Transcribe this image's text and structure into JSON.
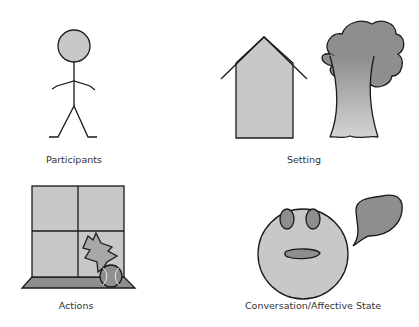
{
  "panels": [
    {
      "id": "participants",
      "label": "Participants",
      "icon": "stick-figure-icon"
    },
    {
      "id": "setting",
      "label": "Setting",
      "icon": "house-and-tree-icon"
    },
    {
      "id": "actions",
      "label": "Actions",
      "icon": "broken-window-ball-icon"
    },
    {
      "id": "conversation",
      "label": "Conversation/Affective State",
      "icon": "face-speech-bubble-icon"
    }
  ],
  "colors": {
    "stroke": "#1a1a1a",
    "light_gray": "#c8c8c8",
    "mid_gray": "#a8a8a8",
    "dark_gray": "#8a8a8a",
    "label": "#333333"
  }
}
